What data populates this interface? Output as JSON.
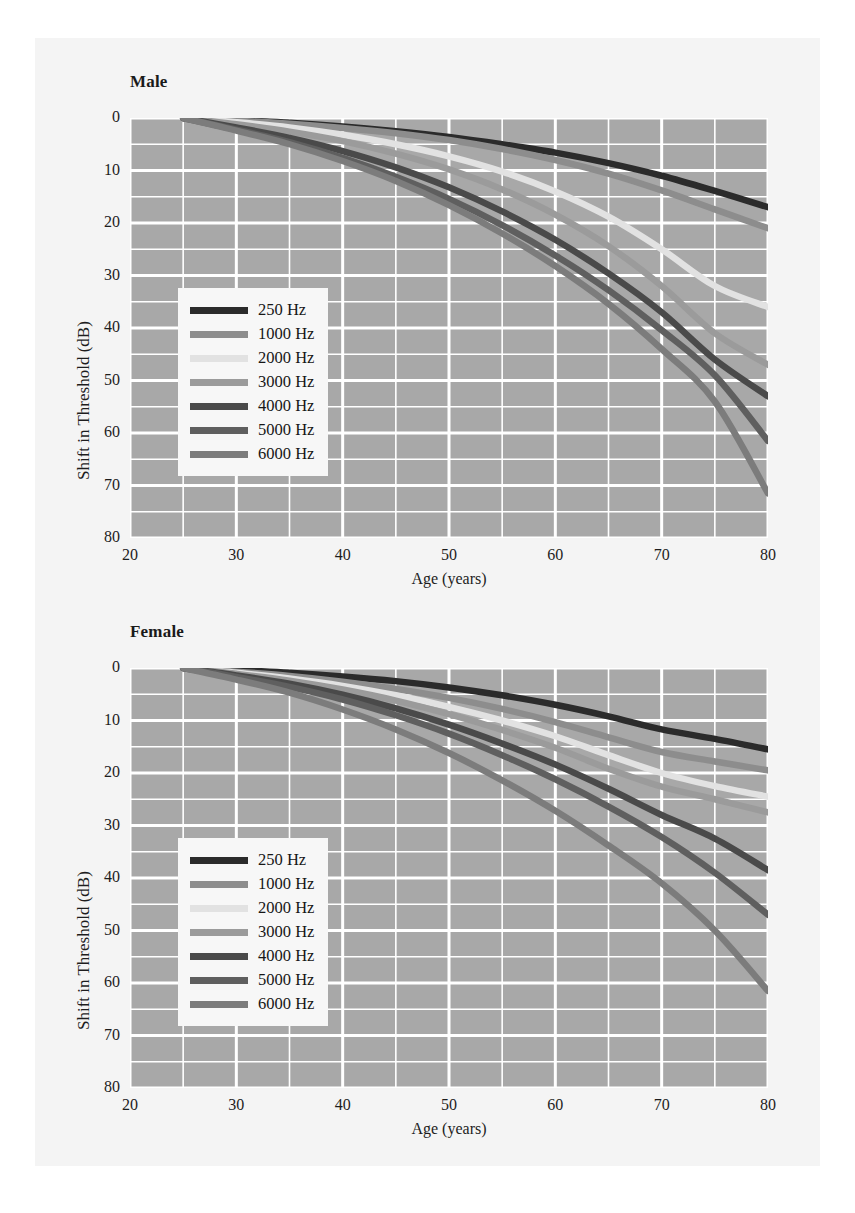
{
  "figure": {
    "background_color": "#f4f4f4",
    "page_color": "#ffffff",
    "plot_background_color": "#a8a8a8",
    "gridline_color": "#ffffff"
  },
  "axes": {
    "xlabel": "Age (years)",
    "ylabel": "Shift in Threshold (dB)",
    "xticks": [
      "20",
      "30",
      "40",
      "50",
      "60",
      "70",
      "80"
    ],
    "yticks": [
      "0",
      "10",
      "20",
      "30",
      "40",
      "50",
      "60",
      "70",
      "80"
    ]
  },
  "legend": {
    "entries": [
      {
        "label": "250 Hz",
        "color": "#2b2b2b"
      },
      {
        "label": "1000 Hz",
        "color": "#8d8d8d"
      },
      {
        "label": "2000 Hz",
        "color": "#e2e2e2"
      },
      {
        "label": "3000 Hz",
        "color": "#9b9b9b"
      },
      {
        "label": "4000 Hz",
        "color": "#4a4a4a"
      },
      {
        "label": "5000 Hz",
        "color": "#5f5f5f"
      },
      {
        "label": "6000 Hz",
        "color": "#7c7c7c"
      }
    ]
  },
  "panels": [
    {
      "id": "male",
      "title": "Male"
    },
    {
      "id": "female",
      "title": "Female"
    }
  ],
  "caption": {
    "text": ""
  },
  "chart_data": [
    {
      "type": "line",
      "title": "Male",
      "xlabel": "Age (years)",
      "ylabel": "Shift in Threshold (dB)",
      "xlim": [
        20,
        80
      ],
      "ylim": [
        0,
        80
      ],
      "y_inverted": true,
      "grid": true,
      "legend_position": "inside-left",
      "x": [
        25,
        30,
        35,
        40,
        45,
        50,
        55,
        60,
        65,
        70,
        75,
        80
      ],
      "series": [
        {
          "name": "250 Hz",
          "color": "#2b2b2b",
          "values": [
            0,
            0.4,
            0.9,
            1.6,
            2.5,
            3.6,
            5.0,
            6.6,
            8.6,
            11.0,
            13.9,
            17.0
          ]
        },
        {
          "name": "1000 Hz",
          "color": "#8d8d8d",
          "values": [
            0,
            0.5,
            1.1,
            1.9,
            2.9,
            4.2,
            5.9,
            8.0,
            10.6,
            13.8,
            17.4,
            21.0
          ]
        },
        {
          "name": "2000 Hz",
          "color": "#e2e2e2",
          "values": [
            0,
            0.8,
            1.8,
            3.2,
            5.0,
            7.3,
            10.2,
            14.0,
            18.8,
            25.0,
            32.0,
            36.0
          ]
        },
        {
          "name": "3000 Hz",
          "color": "#9b9b9b",
          "values": [
            0,
            1.2,
            2.6,
            4.4,
            6.8,
            9.8,
            13.6,
            18.4,
            24.4,
            32.0,
            41.0,
            47.0
          ]
        },
        {
          "name": "4000 Hz",
          "color": "#4a4a4a",
          "values": [
            0,
            1.8,
            3.8,
            6.3,
            9.4,
            13.2,
            17.8,
            23.2,
            29.6,
            37.0,
            46.0,
            53.0
          ]
        },
        {
          "name": "5000 Hz",
          "color": "#5f5f5f",
          "values": [
            0,
            2.2,
            4.6,
            7.6,
            11.2,
            15.4,
            20.4,
            26.2,
            32.8,
            40.4,
            49.0,
            61.5
          ]
        },
        {
          "name": "6000 Hz",
          "color": "#7c7c7c",
          "values": [
            0,
            2.4,
            5.0,
            8.2,
            12.0,
            16.6,
            22.0,
            28.2,
            35.4,
            44.0,
            54.0,
            71.5
          ]
        }
      ]
    },
    {
      "type": "line",
      "title": "Female",
      "xlabel": "Age (years)",
      "ylabel": "Shift in Threshold (dB)",
      "xlim": [
        20,
        80
      ],
      "ylim": [
        0,
        80
      ],
      "y_inverted": true,
      "grid": true,
      "legend_position": "inside-left",
      "x": [
        25,
        30,
        35,
        40,
        45,
        50,
        55,
        60,
        65,
        70,
        75,
        80
      ],
      "series": [
        {
          "name": "250 Hz",
          "color": "#2b2b2b",
          "values": [
            0,
            0.4,
            0.9,
            1.6,
            2.5,
            3.7,
            5.2,
            7.0,
            9.2,
            11.7,
            13.5,
            15.5
          ]
        },
        {
          "name": "1000 Hz",
          "color": "#8d8d8d",
          "values": [
            0,
            0.7,
            1.5,
            2.6,
            4.0,
            5.7,
            7.8,
            10.3,
            13.2,
            16.0,
            17.8,
            19.5
          ]
        },
        {
          "name": "2000 Hz",
          "color": "#e2e2e2",
          "values": [
            0,
            0.9,
            2.0,
            3.4,
            5.2,
            7.4,
            10.0,
            13.0,
            16.6,
            20.0,
            22.5,
            24.5
          ]
        },
        {
          "name": "3000 Hz",
          "color": "#9b9b9b",
          "values": [
            0,
            1.1,
            2.4,
            4.1,
            6.2,
            8.8,
            11.8,
            15.2,
            19.2,
            22.6,
            25.0,
            27.5
          ]
        },
        {
          "name": "4000 Hz",
          "color": "#4a4a4a",
          "values": [
            0,
            1.4,
            3.0,
            5.1,
            7.7,
            10.8,
            14.4,
            18.4,
            23.0,
            28.0,
            32.5,
            38.5
          ]
        },
        {
          "name": "5000 Hz",
          "color": "#5f5f5f",
          "values": [
            0,
            1.7,
            3.6,
            6.0,
            9.0,
            12.5,
            16.6,
            21.2,
            26.4,
            32.2,
            39.0,
            47.0
          ]
        },
        {
          "name": "6000 Hz",
          "color": "#7c7c7c",
          "values": [
            0,
            2.2,
            4.7,
            7.9,
            11.7,
            16.2,
            21.4,
            27.2,
            33.8,
            41.0,
            50.0,
            61.5
          ]
        }
      ]
    }
  ]
}
